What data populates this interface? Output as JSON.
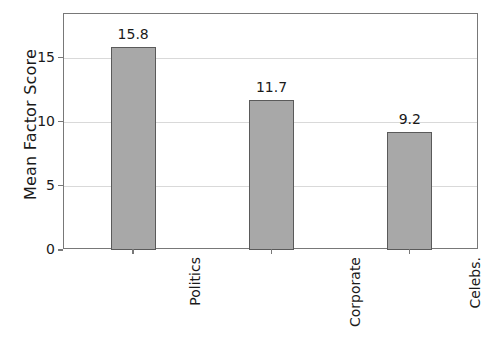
{
  "chart_data": {
    "type": "bar",
    "title": "",
    "xlabel": "",
    "ylabel": "Mean Factor Score",
    "categories": [
      "Politics",
      "Corporate",
      "Celebs."
    ],
    "values": [
      15.8,
      11.7,
      9.2
    ],
    "value_labels": [
      "15.8",
      "11.7",
      "9.2"
    ],
    "ylim": [
      0,
      18.4
    ],
    "yticks": [
      0,
      5,
      10,
      15
    ],
    "ytick_labels": [
      "0",
      "5",
      "10",
      "15"
    ],
    "grid": "horizontal",
    "legend": "none",
    "bar_color": "#a8a8a8",
    "bar_edge_color": "#5a5a5a",
    "grid_color": "#d9d9d9",
    "axis_color": "#787878",
    "text_color": "#1a1a1a",
    "background": "#ffffff"
  }
}
